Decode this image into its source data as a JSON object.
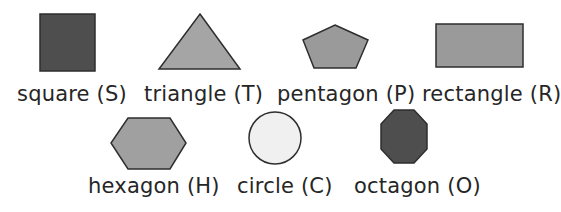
{
  "shapes": [
    {
      "id": "square",
      "label": "square (S)",
      "name": "square",
      "letter": "S",
      "fill": "#4e4e4e",
      "stroke": "#2e2e2e",
      "row": 1
    },
    {
      "id": "triangle",
      "label": "triangle (T)",
      "name": "triangle",
      "letter": "T",
      "fill": "#a5a5a5",
      "stroke": "#2e2e2e",
      "row": 1
    },
    {
      "id": "pentagon",
      "label": "pentagon (P)",
      "name": "pentagon",
      "letter": "P",
      "fill": "#9a9a9a",
      "stroke": "#2e2e2e",
      "row": 1
    },
    {
      "id": "rectangle",
      "label": "rectangle (R)",
      "name": "rectangle",
      "letter": "R",
      "fill": "#9a9a9a",
      "stroke": "#2e2e2e",
      "row": 1
    },
    {
      "id": "hexagon",
      "label": "hexagon (H)",
      "name": "hexagon",
      "letter": "H",
      "fill": "#a0a0a0",
      "stroke": "#2e2e2e",
      "row": 2
    },
    {
      "id": "circle",
      "label": "circle (C)",
      "name": "circle",
      "letter": "C",
      "fill": "#f0f0f0",
      "stroke": "#2e2e2e",
      "row": 2
    },
    {
      "id": "octagon",
      "label": "octagon (O)",
      "name": "octagon",
      "letter": "O",
      "fill": "#4e4e4e",
      "stroke": "#2e2e2e",
      "row": 2
    }
  ]
}
